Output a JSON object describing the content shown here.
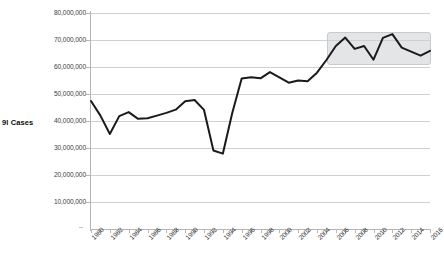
{
  "chart_data": {
    "type": "line",
    "title": "",
    "xlabel": "",
    "ylabel": "9l Cases",
    "ylim": [
      0,
      80000000
    ],
    "xlim": [
      1980,
      2016
    ],
    "grid": true,
    "legend": "none",
    "y_ticks": [
      "80,000,000",
      "70,000,000",
      "60,000,000",
      "50,000,000",
      "40,000,000",
      "30,000,000",
      "20,000,000",
      "10,000,000"
    ],
    "y_tick_values": [
      80000000,
      70000000,
      60000000,
      50000000,
      40000000,
      30000000,
      20000000,
      10000000
    ],
    "x_tick_labels": [
      "1980",
      "1982",
      "1984",
      "1986",
      "1988",
      "1990",
      "1992",
      "1994",
      "1996",
      "1998",
      "2000",
      "2002",
      "2004",
      "2006",
      "2008",
      "2010",
      "2012",
      "2014",
      "2016"
    ],
    "x": [
      1980,
      1981,
      1982,
      1983,
      1984,
      1985,
      1986,
      1987,
      1988,
      1989,
      1990,
      1991,
      1992,
      1993,
      1994,
      1995,
      1996,
      1997,
      1998,
      1999,
      2000,
      2001,
      2002,
      2003,
      2004,
      2005,
      2006,
      2007,
      2008,
      2009,
      2010,
      2011,
      2012,
      2013,
      2014,
      2015,
      2016
    ],
    "values": [
      47400000,
      42000000,
      35200000,
      41800000,
      43300000,
      40800000,
      41000000,
      42000000,
      43000000,
      44200000,
      47300000,
      47800000,
      44100000,
      29100000,
      27900000,
      43000000,
      55700000,
      56200000,
      55800000,
      58100000,
      56200000,
      54200000,
      55000000,
      54700000,
      57900000,
      62600000,
      67800000,
      70900000,
      66700000,
      67800000,
      62700000,
      70800000,
      72200000,
      67200000,
      65700000,
      64200000,
      66000000
    ],
    "series_color": "#1a1a1a",
    "line_width": 2,
    "highlight": {
      "label": "highlight-region",
      "x_start": 2006,
      "x_end": 2016,
      "y_start": 61500000,
      "y_end": 73000000,
      "color": "#cdd0d1"
    }
  }
}
